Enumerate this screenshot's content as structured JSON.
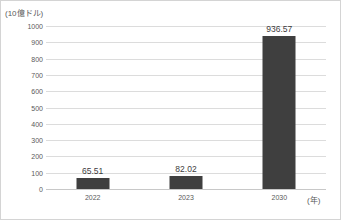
{
  "chart_data": {
    "type": "bar",
    "title": "",
    "subtitle": "",
    "xlabel": "(年)",
    "ylabel": "(10億ドル)",
    "categories": [
      "2022",
      "2023",
      "2030"
    ],
    "values": [
      65.51,
      82.02,
      936.57
    ],
    "value_labels": [
      "65.51",
      "82.02",
      "936.57"
    ],
    "series": [
      {
        "name": "",
        "values": [
          65.51,
          82.02,
          936.57
        ],
        "color": "#3f3f3f"
      }
    ],
    "ylim": [
      0,
      1000
    ],
    "ytick_step": 100,
    "ytick_labels": [
      "1000",
      "900",
      "800",
      "700",
      "600",
      "500",
      "400",
      "300",
      "200",
      "100",
      "0"
    ],
    "ytick_values": [
      1000,
      900,
      800,
      700,
      600,
      500,
      400,
      300,
      200,
      100,
      0
    ],
    "grid": true,
    "grid_axis": "y",
    "legend": false,
    "legend_position": "none",
    "bar_color": "#3f3f3f",
    "gridline_color": "#dcdcdc",
    "axis_text_color": "#5a5a5a"
  }
}
